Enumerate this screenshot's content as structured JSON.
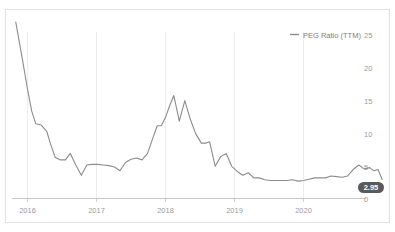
{
  "chart_data": {
    "type": "line",
    "title": "",
    "xlabel": "",
    "ylabel": "",
    "legend": [
      {
        "name": "PEG Ratio (TTM)",
        "color": "#8c8c8c"
      }
    ],
    "legend_position": "top-right",
    "grid": true,
    "xlim": [
      "2015-10",
      "2021-01"
    ],
    "ylim": [
      0,
      27.5
    ],
    "xticks": [
      "2016",
      "2017",
      "2018",
      "2019",
      "2020"
    ],
    "yticks": [
      "0",
      "5",
      "10",
      "15",
      "20",
      "25"
    ],
    "ytick_values": [
      0,
      5,
      10,
      15,
      20,
      25
    ],
    "last_value_badge": "2.95",
    "series": [
      {
        "name": "PEG Ratio (TTM)",
        "color": "#8c8c8c",
        "x": [
          2015.83,
          2015.92,
          2016.0,
          2016.06,
          2016.12,
          2016.2,
          2016.28,
          2016.33,
          2016.4,
          2016.47,
          2016.55,
          2016.62,
          2016.7,
          2016.78,
          2016.86,
          2016.94,
          2017.02,
          2017.1,
          2017.18,
          2017.26,
          2017.34,
          2017.42,
          2017.5,
          2017.58,
          2017.66,
          2017.74,
          2017.82,
          2017.88,
          2017.94,
          2018.0,
          2018.06,
          2018.12,
          2018.2,
          2018.28,
          2018.36,
          2018.44,
          2018.52,
          2018.58,
          2018.64,
          2018.72,
          2018.8,
          2018.88,
          2018.96,
          2019.04,
          2019.12,
          2019.2,
          2019.28,
          2019.36,
          2019.44,
          2019.52,
          2019.6,
          2019.68,
          2019.76,
          2019.84,
          2019.92,
          2020.0,
          2020.08,
          2020.16,
          2020.24,
          2020.32,
          2020.4,
          2020.48,
          2020.56,
          2020.64,
          2020.72,
          2020.8,
          2020.88,
          2020.96
        ],
        "y": [
          27.4,
          22.0,
          17.0,
          13.6,
          11.6,
          11.4,
          10.4,
          8.6,
          6.4,
          6.0,
          6.0,
          7.0,
          5.2,
          3.6,
          5.2,
          5.3,
          5.3,
          5.2,
          5.1,
          4.9,
          4.3,
          5.6,
          6.1,
          6.3,
          6.0,
          7.0,
          9.5,
          11.3,
          11.3,
          12.6,
          14.4,
          16.0,
          12.0,
          15.2,
          12.3,
          10.0,
          8.6,
          8.6,
          8.8,
          5.0,
          6.5,
          7.0,
          5.0,
          4.2,
          3.6,
          4.0,
          3.2,
          3.2,
          2.9,
          2.8,
          2.8,
          2.8,
          2.8,
          2.9,
          2.7,
          2.8,
          3.0,
          3.2,
          3.2,
          3.2,
          3.5,
          3.4,
          3.3,
          3.5,
          4.5,
          5.2,
          4.6,
          4.8
        ]
      }
    ],
    "series_tail": {
      "x": [
        2020.96,
        2021.02,
        2021.08,
        2021.14
      ],
      "y": [
        4.8,
        4.3,
        4.5,
        2.95
      ]
    }
  },
  "axes": {
    "y_labels": [
      "25",
      "20",
      "15",
      "10",
      "5",
      "0"
    ],
    "x_labels": [
      "2016",
      "2017",
      "2018",
      "2019",
      "2020"
    ]
  },
  "legend": {
    "label": "PEG Ratio (TTM)"
  },
  "badge": {
    "value": "2.95"
  }
}
